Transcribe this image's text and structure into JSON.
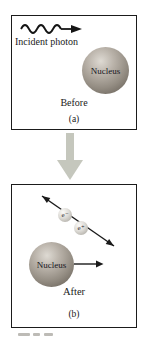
{
  "diagram": {
    "title_semantic": "pair-production before/after diagram",
    "panel_a": {
      "photon_label": "Incident photon",
      "nucleus_label": "Nucleus",
      "state_label": "Before",
      "panel_label": "(a)"
    },
    "panel_b": {
      "electron_label": "e⁻",
      "positron_label": "e⁺",
      "nucleus_label": "Nucleus",
      "state_label": "After",
      "panel_label": "(b)"
    },
    "colors": {
      "stroke": "#1b1b1b",
      "nucleus_highlight": "#dedad3",
      "nucleus_mid": "#938c82",
      "nucleus_shadow": "#6b645b",
      "particle_fill": "#dddbd6",
      "transition_arrow": "#c5c7bd",
      "background": "#ffffff"
    }
  }
}
